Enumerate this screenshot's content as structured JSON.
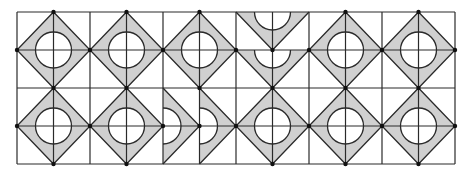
{
  "diagram": {
    "title": "",
    "grid": {
      "left": 17,
      "top": 12,
      "right": 455,
      "bottom": 164,
      "cols": 12,
      "rows": 4
    },
    "tiles": {
      "cols": 6,
      "rows": 2,
      "layout": [
        [
          "full",
          "full",
          "full",
          "half-bottom-stacked",
          "full",
          "full"
        ],
        [
          "full",
          "full",
          "half-right-paired",
          "full",
          "full",
          "full"
        ]
      ]
    },
    "colors": {
      "fill": "#d0d0d0",
      "line": "#2a2a2a",
      "background": "#ffffff",
      "dot": "#111111"
    },
    "circle_radius": 18
  }
}
